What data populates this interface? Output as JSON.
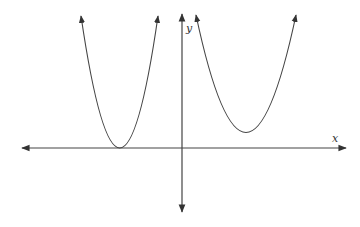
{
  "diagram": {
    "type": "coordinate-plane-sketch",
    "colors": {
      "background": "#ffffff",
      "stroke": "#444444"
    },
    "axes": {
      "x_label": "x",
      "y_label": "y"
    },
    "curves": [
      {
        "name": "left-parabola",
        "opens": "up",
        "vertex_note": "vertex touches the x-axis, left of the y-axis"
      },
      {
        "name": "right-parabola",
        "opens": "up",
        "vertex_note": "vertex above the x-axis, right of the y-axis"
      }
    ]
  }
}
